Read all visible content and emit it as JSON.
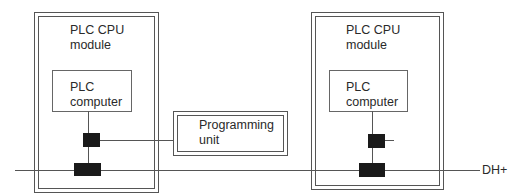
{
  "diagram": {
    "left_module": {
      "title_line1": "PLC CPU",
      "title_line2": "module",
      "computer_line1": "PLC",
      "computer_line2": "computer"
    },
    "right_module": {
      "title_line1": "PLC CPU",
      "title_line2": "module",
      "computer_line1": "PLC",
      "computer_line2": "computer"
    },
    "programming_unit": {
      "line1": "Programming",
      "line2": "unit"
    },
    "bus_label": "DH+",
    "colors": {
      "line": "#555555",
      "connector": "#1a1a1a",
      "background": "#ffffff"
    }
  }
}
